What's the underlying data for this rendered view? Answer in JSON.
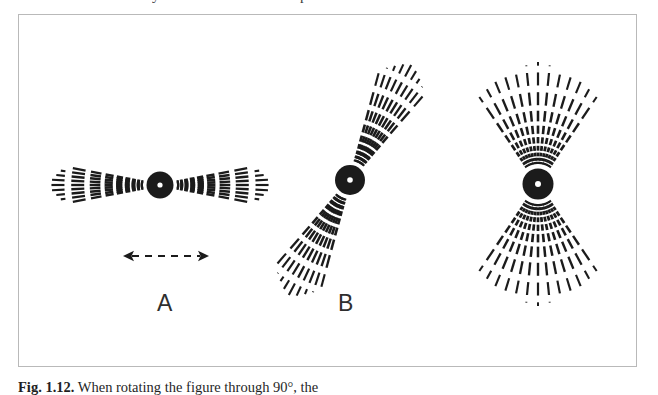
{
  "page": {
    "background_color": "#ffffff",
    "frame_color": "#b9b9b9",
    "ink_color": "#1b1b1b"
  },
  "top_clipped_text": {
    "fragment_left": "y",
    "fragment_right": "p"
  },
  "caption": {
    "label": "Fig. 1.12.",
    "text": " When rotating the figure through 90°, the"
  },
  "figure": {
    "labels": [
      {
        "name": "A",
        "text": "A",
        "x": 157,
        "y": 292
      },
      {
        "name": "B",
        "text": "B",
        "x": 338,
        "y": 292
      }
    ],
    "arrow": {
      "name": "double-headed-dashed-arrow",
      "x1": 123,
      "x2": 209,
      "y": 256,
      "style": "dashed",
      "heads": "both"
    },
    "emitters": [
      {
        "id": "A",
        "name": "dipole-emitter-a",
        "cx": 160,
        "cy": 185,
        "disc_radius": 13.5,
        "core_dot_radius": 2.6,
        "axis_angle_deg": 0,
        "half_fan_deg": 11,
        "ray_count": 9,
        "inner_radius": 17,
        "outer_radius": 112,
        "dash_pattern": "graded"
      },
      {
        "id": "B",
        "name": "dipole-emitter-b",
        "cx": 350,
        "cy": 180,
        "disc_radius": 15,
        "core_dot_radius": 2.8,
        "axis_angle_deg": -62,
        "half_fan_deg": 13,
        "ray_count": 9,
        "inner_radius": 19,
        "outer_radius": 132,
        "dash_pattern": "graded"
      },
      {
        "id": "C",
        "name": "dipole-emitter-c",
        "cx": 538,
        "cy": 184,
        "disc_radius": 15.5,
        "core_dot_radius": 3.0,
        "axis_angle_deg": -90,
        "half_fan_deg": 34,
        "ray_count": 13,
        "inner_radius": 20,
        "outer_radius": 122,
        "dash_pattern": "graded"
      }
    ]
  }
}
